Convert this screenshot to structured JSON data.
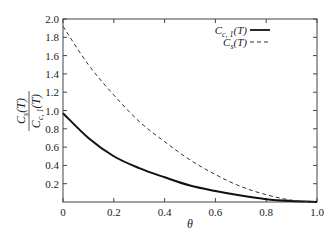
{
  "chart_data": {
    "type": "line",
    "title": "",
    "xlabel": "θ",
    "ylabel": "C_s(T) / C_{c,1}(T)",
    "xlim": [
      0,
      1.0
    ],
    "ylim": [
      0,
      2.0
    ],
    "x_ticks": [
      "0",
      "0.2",
      "0.4",
      "0.6",
      "0.8",
      "1.0"
    ],
    "y_ticks": [
      "0.2",
      "0.4",
      "0.6",
      "0.8",
      "1.0",
      "1.2",
      "1.4",
      "1.6",
      "1.8",
      "2.0"
    ],
    "grid": false,
    "legend_position": "upper right",
    "x": [
      0,
      0.1,
      0.2,
      0.3,
      0.4,
      0.5,
      0.6,
      0.7,
      0.8,
      0.9,
      1.0
    ],
    "series": [
      {
        "name": "C_{c,1}(T)",
        "style": "solid",
        "values": [
          0.97,
          0.7,
          0.5,
          0.37,
          0.27,
          0.18,
          0.12,
          0.07,
          0.03,
          0.01,
          0.0
        ]
      },
      {
        "name": "C_s(T)",
        "style": "dashed",
        "values": [
          1.92,
          1.5,
          1.17,
          0.88,
          0.66,
          0.46,
          0.3,
          0.17,
          0.08,
          0.02,
          0.0
        ]
      }
    ]
  },
  "labels": {
    "xlabel": "θ",
    "ylabel_num_main": "C",
    "ylabel_num_sub": "s",
    "ylabel_num_tail": "(T)",
    "ylabel_den_main": "C",
    "ylabel_den_sub": "c, 1",
    "ylabel_den_tail": "(T)",
    "legend": [
      {
        "main": "C",
        "sub": "c, 1",
        "tail": "(T)"
      },
      {
        "main": "C",
        "sub": "s",
        "tail": "(T)"
      }
    ]
  }
}
